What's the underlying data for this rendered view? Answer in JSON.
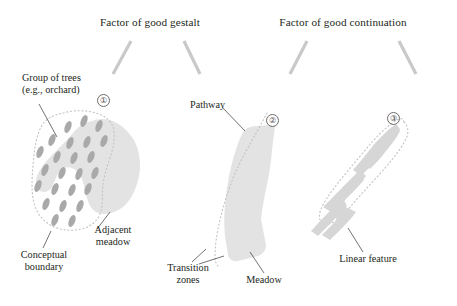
{
  "figure": {
    "title_left": "Factor of good gestalt",
    "title_right": "Factor of good continuation",
    "background_color": "#ffffff",
    "ink_color": "#231f20",
    "fill_light": "#e3e3e3",
    "fill_mid": "#a9a9a9",
    "connector_color": "#c9c9c9",
    "dotted_color": "#c0c0c0"
  },
  "panels": [
    {
      "id": "panel-1",
      "number": "①",
      "labels": {
        "group_of_trees_line1": "Group of trees",
        "group_of_trees_line2": "(e.g., orchard)",
        "adjacent_meadow_line1": "Adjacent",
        "adjacent_meadow_line2": "meadow",
        "conceptual_boundary_line1": "Conceptual",
        "conceptual_boundary_line2": "boundary"
      }
    },
    {
      "id": "panel-2",
      "number": "②",
      "labels": {
        "pathway": "Pathway",
        "transition_zones_line1": "Transition",
        "transition_zones_line2": "zones",
        "meadow": "Meadow"
      }
    },
    {
      "id": "panel-3",
      "number": "③",
      "labels": {
        "linear_feature": "Linear feature"
      }
    }
  ]
}
